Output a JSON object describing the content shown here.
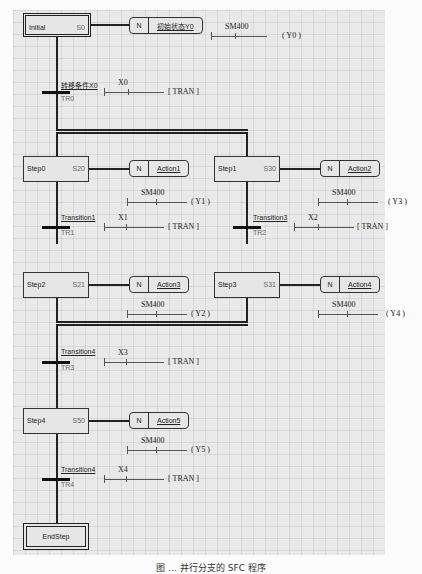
{
  "diagram": {
    "type": "SFC (Sequential Function Chart)",
    "initial_step": {
      "name": "Initial",
      "id": "S0",
      "action": {
        "qualifier": "N",
        "label": "初始状态Y0",
        "contact": "SM400",
        "coil": "( Y0 )"
      }
    },
    "transitions": [
      {
        "label": "转移条件X0",
        "id": "TR0",
        "contact": "X0",
        "target": "[ TRAN ]"
      },
      {
        "label": "Transition1",
        "id": "TR1",
        "contact": "X1",
        "target": "[ TRAN ]"
      },
      {
        "label": "Transition3",
        "id": "TR2",
        "contact": "X2",
        "target": "[ TRAN ]"
      },
      {
        "label": "Transition4",
        "id": "TR3",
        "contact": "X3",
        "target": "[ TRAN ]"
      },
      {
        "label": "Transition4",
        "id": "TR4",
        "contact": "X4",
        "target": "[ TRAN ]"
      }
    ],
    "steps": [
      {
        "name": "Step0",
        "id": "S20",
        "action": {
          "qualifier": "N",
          "label": "Action1",
          "contact": "SM400",
          "coil": "( Y1 )"
        }
      },
      {
        "name": "Step1",
        "id": "S30",
        "action": {
          "qualifier": "N",
          "label": "Action2",
          "contact": "SM400",
          "coil": "( Y3 )"
        }
      },
      {
        "name": "Step2",
        "id": "S21",
        "action": {
          "qualifier": "N",
          "label": "Action3",
          "contact": "SM400",
          "coil": "( Y2 )"
        }
      },
      {
        "name": "Step3",
        "id": "S31",
        "action": {
          "qualifier": "N",
          "label": "Action4",
          "contact": "SM400",
          "coil": "( Y4 )"
        }
      },
      {
        "name": "Step4",
        "id": "S50",
        "action": {
          "qualifier": "N",
          "label": "Action5",
          "contact": "SM400",
          "coil": "( Y5 )"
        }
      }
    ],
    "end_step": {
      "name": "EndStep"
    },
    "caption": "图 … 并行分支的 SFC 程序"
  }
}
